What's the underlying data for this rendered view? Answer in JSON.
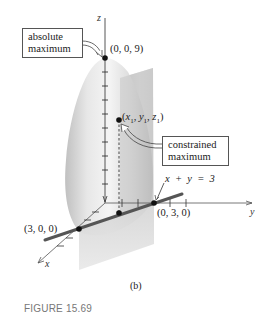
{
  "figure": {
    "number": "FIGURE 15.69",
    "subcaption": "(b)",
    "axes": {
      "x": "x",
      "y": "y",
      "z": "z"
    },
    "points": {
      "absolute_max": "(0, 0, 9)",
      "constrained_max_x": "x",
      "constrained_max_y": "y",
      "constrained_max_z": "z",
      "sub1": "1",
      "on_y_axis": "(0, 3, 0)",
      "on_x_axis": "(3, 0, 0)"
    },
    "constraint_equation": "x  +  y  =  3",
    "callouts": {
      "absolute_max_line1": "absolute",
      "absolute_max_line2": "maximum",
      "constrained_max_line1": "constrained",
      "constrained_max_line2": "maximum"
    },
    "colors": {
      "surface_light": "#f2f2f2",
      "surface_mid": "#d6d6d6",
      "surface_dark": "#b8b8b8",
      "plane": "#cfcfcf",
      "constraint_line": "#555555",
      "axis": "#444444",
      "point": "#111111"
    }
  }
}
